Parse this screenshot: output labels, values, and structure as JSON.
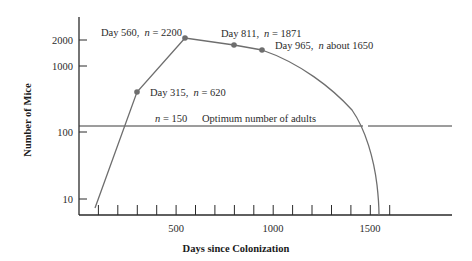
{
  "chart_data": {
    "type": "line",
    "title": "",
    "xlabel": "Days since Colonization",
    "ylabel": "Number of Mice",
    "x_scale": "linear",
    "y_scale": "log",
    "xlim": [
      0,
      1900
    ],
    "ylim": [
      6,
      3500
    ],
    "x_ticks": [
      500,
      1000,
      1500
    ],
    "x_minor_tick_interval": 100,
    "y_ticks": [
      10,
      100,
      1000,
      2000
    ],
    "grid": false,
    "legend": null,
    "series": [
      {
        "name": "Mouse population",
        "color": "#6b6b6b",
        "points": [
          {
            "x": 80,
            "y": 20
          },
          {
            "x": 315,
            "y": 620
          },
          {
            "x": 560,
            "y": 2200
          },
          {
            "x": 811,
            "y": 1871
          },
          {
            "x": 965,
            "y": 1650
          },
          {
            "x": 1200,
            "y": 900
          },
          {
            "x": 1460,
            "y": 150
          },
          {
            "x": 1545,
            "y": 6
          }
        ]
      }
    ],
    "reference_line": {
      "y": 150,
      "label_n": "n = 150",
      "label": "Optimum number of adults"
    },
    "annotations": [
      {
        "x": 560,
        "y": 2200,
        "text": "Day 560,  n = 2200"
      },
      {
        "x": 315,
        "y": 620,
        "text": "Day 315,  n = 620"
      },
      {
        "x": 811,
        "y": 1871,
        "text": "Day 811,  n = 1871"
      },
      {
        "x": 965,
        "y": 1650,
        "text": "Day 965,  n about 1650"
      }
    ]
  },
  "labels": {
    "y_ticks": [
      "2000",
      "1000",
      "100",
      "10"
    ],
    "x_ticks": [
      "500",
      "1000",
      "1500"
    ],
    "xlabel": "Days since Colonization",
    "ylabel": "Number of Mice",
    "ann_560": "Day 560,",
    "ann_560_n": "n",
    "ann_560_v": " = 2200",
    "ann_315": "Day 315,",
    "ann_315_n": "n",
    "ann_315_v": " = 620",
    "ann_811": "Day 811,",
    "ann_811_n": "n",
    "ann_811_v": " = 1871",
    "ann_965": "Day 965,",
    "ann_965_n": "n",
    "ann_965_v": " about 1650",
    "ref_n": "n",
    "ref_v": " = 150",
    "ref_label": "Optimum number of adults"
  },
  "colors": {
    "axis": "#2a2a2a",
    "curve": "#6e6e6e",
    "point": "#6e6e6e",
    "ref_line": "#3a3a3a"
  }
}
